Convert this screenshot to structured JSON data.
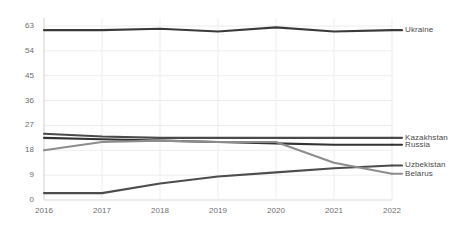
{
  "chart_data": {
    "type": "line",
    "title": "",
    "subtitle": "",
    "xlabel": "",
    "ylabel": "",
    "categories": [
      "2016",
      "2017",
      "2018",
      "2019",
      "2020",
      "2021",
      "2022"
    ],
    "x": [
      2016,
      2017,
      2018,
      2019,
      2020,
      2021,
      2022
    ],
    "ylim": [
      0,
      63
    ],
    "yticks": [
      0,
      9,
      18,
      27,
      36,
      45,
      54,
      63
    ],
    "ytick_labels": [
      "0",
      "9",
      "18",
      "27",
      "36",
      "45",
      "54",
      "63"
    ],
    "grid": true,
    "grid_axis": "both",
    "legend_position": "right-inline",
    "series": [
      {
        "name": "Ukraine",
        "color": "#3a3a3a",
        "label_y": 61.5,
        "values": [
          61.5,
          61.5,
          62.0,
          61.0,
          62.5,
          61.0,
          61.5
        ]
      },
      {
        "name": "Kazakhstan",
        "color": "#4a4a4a",
        "label_y": 22.5,
        "values": [
          24.0,
          23.0,
          22.5,
          22.5,
          22.5,
          22.5,
          22.5
        ]
      },
      {
        "name": "Russia",
        "color": "#333333",
        "label_y": 20.0,
        "values": [
          22.5,
          22.0,
          21.5,
          21.0,
          20.5,
          20.0,
          20.0
        ]
      },
      {
        "name": "Uzbekistan",
        "color": "#4d4d4d",
        "label_y": 12.5,
        "values": [
          2.5,
          2.5,
          6.0,
          8.5,
          10.0,
          11.5,
          12.5
        ]
      },
      {
        "name": "Belarus",
        "color": "#8d8d8d",
        "label_y": 9.5,
        "values": [
          18.0,
          21.0,
          21.5,
          21.0,
          21.0,
          13.5,
          9.5
        ]
      }
    ],
    "colors": {
      "grid": "#ededed",
      "axis": "#d9d9d9",
      "tick_text": "#6e6e6e",
      "label_text": "#4a4a4a",
      "background": "#ffffff"
    }
  }
}
